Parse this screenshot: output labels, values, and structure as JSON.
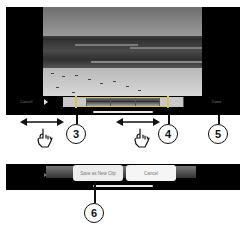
{
  "editor": {
    "cancel_label": "Cancel",
    "done_label": "Done",
    "play_icon": "play-icon",
    "filmstrip_frames": 5
  },
  "callouts": {
    "c3": "3",
    "c4": "4",
    "c5": "5",
    "c6": "6"
  },
  "gestures": {
    "left_drag": "drag-left-right-gesture",
    "right_drag": "drag-left-right-gesture"
  },
  "save_dialog": {
    "save_label": "Save as New Clip",
    "cancel_label": "Cancel"
  },
  "colors": {
    "trim_handle": "#d9c25a",
    "frame": "#000000"
  }
}
